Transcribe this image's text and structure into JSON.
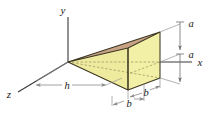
{
  "figure": {
    "kind": "3d-wedge-solid-with-dimensions",
    "background_color": "#ffffff",
    "axes": {
      "x_label": "x",
      "y_label": "y",
      "z_label": "z",
      "axis_color": "#3a3a3a"
    },
    "dimensions": {
      "depth_label": "h",
      "height_upper_label": "a",
      "height_lower_label": "a",
      "width_front_label": "b",
      "width_back_label": "b",
      "leader_color": "#8a8a8a"
    },
    "solid": {
      "top_slant_face_color": "#c8a285",
      "side_face_color": "#f2efa6",
      "front_face_color": "#efeb9e",
      "outline_color": "#3c3722",
      "hidden_edge_style": "dashed"
    }
  }
}
